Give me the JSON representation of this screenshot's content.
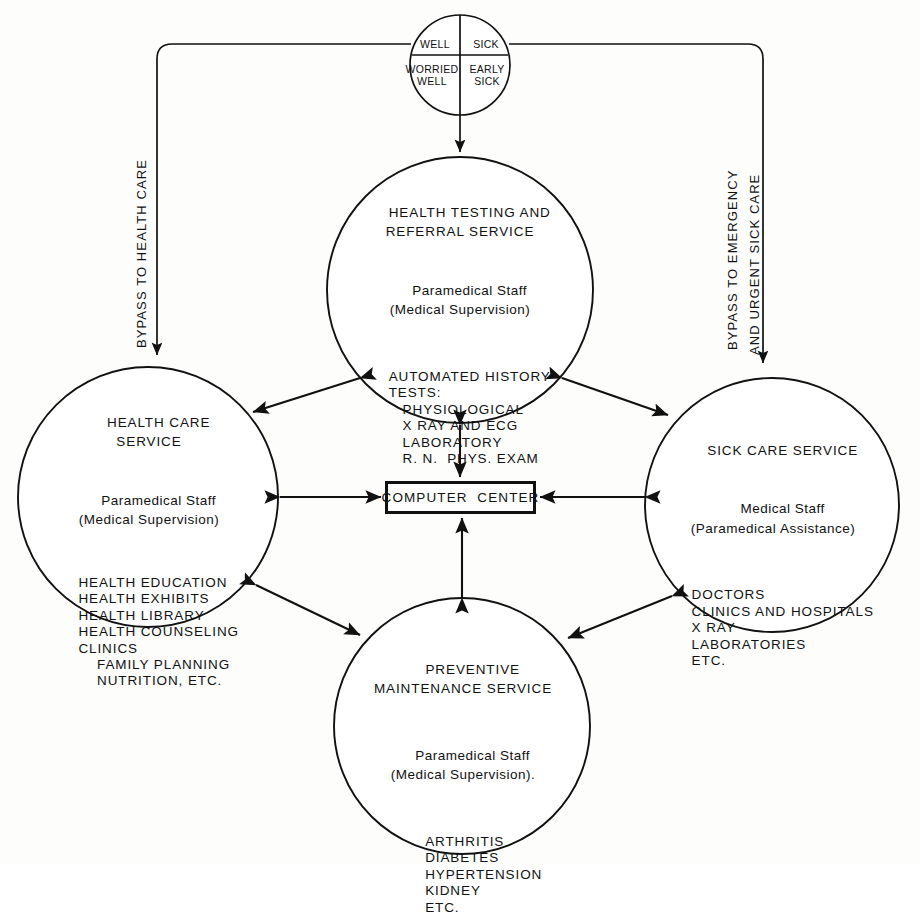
{
  "diagram": {
    "ink_color": "#111111",
    "background_color": "#fdfdfc"
  },
  "patient_circle": {
    "name": "patient-population-circle",
    "segments": [
      {
        "id": "well",
        "label": "WELL"
      },
      {
        "id": "sick",
        "label": "SICK"
      },
      {
        "id": "worried-well",
        "label": "WORRIED\nWELL"
      },
      {
        "id": "early-sick",
        "label": "EARLY\nSICK"
      }
    ]
  },
  "bypass_labels": {
    "left": "BYPASS TO HEALTH CARE",
    "right_line1": "BYPASS TO EMERGENCY",
    "right_line2": "AND URGENT SICK CARE"
  },
  "computer_center": {
    "label": "COMPUTER  CENTER"
  },
  "nodes": {
    "health_testing": {
      "heading": "HEALTH TESTING AND\nREFERRAL SERVICE",
      "staff": "Paramedical Staff\n(Medical Supervision)",
      "body": "AUTOMATED HISTORY\nTESTS:\n   PHYSIOLOGICAL\n   X RAY AND ECG\n   LABORATORY\n   R. N.  PHYS. EXAM"
    },
    "health_care": {
      "heading": "HEALTH CARE\nSERVICE",
      "staff": "Paramedical Staff\n(Medical Supervision)",
      "body": "HEALTH EDUCATION\nHEALTH EXHIBITS\nHEALTH LIBRARY\nHEALTH COUNSELING\nCLINICS\n    FAMILY PLANNING\n    NUTRITION, ETC."
    },
    "sick_care": {
      "heading": "SICK CARE SERVICE",
      "staff": "Medical Staff\n(Paramedical Assistance)",
      "body": "DOCTORS\nCLINICS AND HOSPITALS\nX RAY\nLABORATORIES\nETC."
    },
    "preventive_maintenance": {
      "heading": "PREVENTIVE\nMAINTENANCE SERVICE",
      "staff": "Paramedical Staff\n(Medical Supervision).",
      "body": "ARTHRITIS\nDIABETES\nHYPERTENSION\nKIDNEY\nETC."
    }
  },
  "connectors": [
    {
      "id": "patient-to-testing",
      "from": "patient_circle",
      "to": "health_testing",
      "arrows": "single"
    },
    {
      "id": "bypass-left",
      "from": "patient_circle",
      "to": "health_care",
      "arrows": "single"
    },
    {
      "id": "bypass-right",
      "from": "patient_circle",
      "to": "sick_care",
      "arrows": "single"
    },
    {
      "id": "testing-health-care",
      "from": "health_testing",
      "to": "health_care",
      "arrows": "double"
    },
    {
      "id": "testing-sick-care",
      "from": "health_testing",
      "to": "sick_care",
      "arrows": "double"
    },
    {
      "id": "testing-computer",
      "from": "health_testing",
      "to": "computer_center",
      "arrows": "double"
    },
    {
      "id": "health-care-computer",
      "from": "health_care",
      "to": "computer_center",
      "arrows": "double"
    },
    {
      "id": "sick-care-computer",
      "from": "sick_care",
      "to": "computer_center",
      "arrows": "double"
    },
    {
      "id": "preventive-computer",
      "from": "preventive_maintenance",
      "to": "computer_center",
      "arrows": "double"
    },
    {
      "id": "health-care-preventive",
      "from": "health_care",
      "to": "preventive_maintenance",
      "arrows": "double"
    },
    {
      "id": "sick-care-preventive",
      "from": "sick_care",
      "to": "preventive_maintenance",
      "arrows": "double"
    }
  ]
}
